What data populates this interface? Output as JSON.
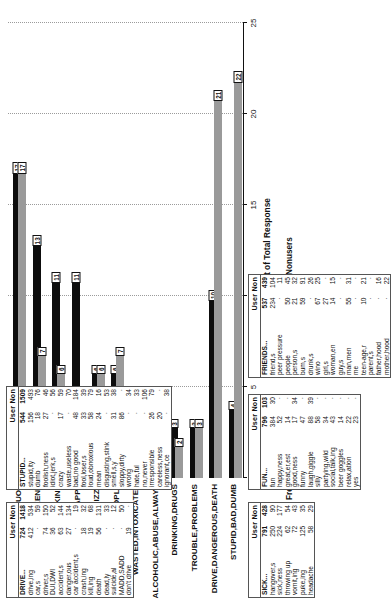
{
  "chart_data": {
    "type": "bar",
    "orientation": "horizontal",
    "xlabel": "Percent of Total Response",
    "ylabel": "",
    "xlim": [
      0,
      25
    ],
    "xticks": [
      0,
      5,
      10,
      15,
      20,
      25
    ],
    "grid": true,
    "legend_position": "bottom",
    "categories": [
      "ALCOHOL,BEER,LIQUOR",
      "PARTY,BAR,WEEKEND",
      "SICK,HANGOVER,PUKING",
      "FUN,LAUGH,HAPPY",
      "PASS OUT,FALL,DIZZY",
      "FRIENDS,BUMS,PEOPLE",
      "WASTED,INTOXICATED",
      "ALCOHOLIC,ABUSE,ALWAYS",
      "DRINKING,DRUGS",
      "TROUBLE,PROBLEMS",
      "DRIVE,DANGEROUS,DEATH",
      "STUPID,BAD,DUMB"
    ],
    "series": [
      {
        "name": "Frequent Users",
        "color": "#0d0d0d",
        "values": [
          17,
          13,
          11,
          11,
          6,
          6,
          4,
          3,
          3,
          3,
          10,
          4
        ]
      },
      {
        "name": "Nonusers",
        "color": "#9a9a9a",
        "values": [
          17,
          7,
          6,
          4,
          6,
          7,
          3,
          2,
          2,
          3,
          21,
          22
        ]
      }
    ]
  },
  "tables": [
    {
      "id": "drive-table",
      "header": "User Non",
      "col_user": "User",
      "col_non": "Non",
      "rows": [
        {
          "label": "DRIVE...",
          "user": "724",
          "non": "1418"
        },
        {
          "label": "drive,ing",
          "user": "412",
          "non": "534"
        },
        {
          "label": "car,s",
          "user": "·",
          "non": "59"
        },
        {
          "label": "driver,s",
          "user": "74",
          "non": "150"
        },
        {
          "label": "DUI,DWI",
          "user": "36",
          "non": "52"
        },
        {
          "label": "accident,s",
          "user": "63",
          "non": "144"
        },
        {
          "label": "danger,ous",
          "user": "27",
          "non": "134"
        },
        {
          "label": "car accident,s",
          "user": "·",
          "non": "19"
        },
        {
          "label": "crash,ing",
          "user": "18",
          "non": "32"
        },
        {
          "label": "kill,ing",
          "user": "19",
          "non": "68"
        },
        {
          "label": "death",
          "user": "56",
          "non": "131"
        },
        {
          "label": "dead,ly",
          "user": "·",
          "non": "33"
        },
        {
          "label": "suicide,al",
          "user": "·",
          "non": "12"
        },
        {
          "label": "MADD,SADD",
          "user": "·",
          "non": "50"
        },
        {
          "label": "don't drive",
          "user": "19",
          "non": "·"
        }
      ]
    },
    {
      "id": "stupid-table",
      "header": "User Non",
      "col_user": "User",
      "col_non": "Non",
      "rows": [
        {
          "label": "STUPID...",
          "user": "544",
          "non": "1509"
        },
        {
          "label": "stupid,ity",
          "user": "156",
          "non": "493"
        },
        {
          "label": "dumb",
          "user": "18",
          "non": "76"
        },
        {
          "label": "foolish,ness",
          "user": "27",
          "non": "46"
        },
        {
          "label": "idiot,jerk,s",
          "user": "·",
          "non": "56"
        },
        {
          "label": "crazy",
          "user": "17",
          "non": "59"
        },
        {
          "label": "waste,useless",
          "user": "·",
          "non": "70"
        },
        {
          "label": "bad,no good",
          "user": "48",
          "non": "184"
        },
        {
          "label": "fool,loser,s",
          "user": "33",
          "non": "39"
        },
        {
          "label": "loud,obnoxious",
          "user": "58",
          "non": "79"
        },
        {
          "label": "mean",
          "user": "24",
          "non": "16"
        },
        {
          "label": "disgusting,stink",
          "user": "·",
          "non": "53"
        },
        {
          "label": "smell,s,y",
          "user": "31",
          "non": "38"
        },
        {
          "label": "sloppy,dirty",
          "user": "86",
          "non": "·"
        },
        {
          "label": "wrong",
          "user": "·",
          "non": "34"
        },
        {
          "label": "hate,ful",
          "user": "·",
          "non": "33"
        },
        {
          "label": "no,never",
          "user": "·",
          "non": "106"
        },
        {
          "label": "irresponsible",
          "user": "26",
          "non": "79"
        },
        {
          "label": "careless,ness",
          "user": "20",
          "non": "·"
        },
        {
          "label": "ignorant,ce",
          "user": "·",
          "non": "38"
        }
      ]
    },
    {
      "id": "sick-table",
      "header": "User Non",
      "col_user": "User",
      "col_non": "Non",
      "rows": [
        {
          "label": "SICK...",
          "user": "791",
          "non": "428"
        },
        {
          "label": "hangover,s",
          "user": "250",
          "non": "90"
        },
        {
          "label": "sick,ness",
          "user": "224",
          "non": "177"
        },
        {
          "label": "throwing up",
          "user": "62",
          "non": "54"
        },
        {
          "label": "vomit,ing",
          "user": "72",
          "non": "43"
        },
        {
          "label": "puke,ing",
          "user": "125",
          "non": "35"
        },
        {
          "label": "headache",
          "user": "58",
          "non": "29"
        }
      ]
    },
    {
      "id": "fun-table",
      "header": "User Non",
      "col_user": "User",
      "col_non": "Non",
      "rows": [
        {
          "label": "FUN...",
          "user": "796",
          "non": "103"
        },
        {
          "label": "fun",
          "user": "384",
          "non": "30"
        },
        {
          "label": "happy,ness",
          "user": "52",
          "non": "·"
        },
        {
          "label": "great,er,est",
          "user": "14",
          "non": "·"
        },
        {
          "label": "good,ness",
          "user": "17",
          "non": "34"
        },
        {
          "label": "funny",
          "user": "47",
          "non": "·"
        },
        {
          "label": "laugh,giggle",
          "user": "88",
          "non": "39"
        },
        {
          "label": "silly",
          "user": "58",
          "non": "·"
        },
        {
          "label": "partying,wild",
          "user": "34",
          "non": "·"
        },
        {
          "label": "social,talk,ing",
          "user": "43",
          "non": "·"
        },
        {
          "label": "beer goggles",
          "user": "14",
          "non": "·"
        },
        {
          "label": "relax,ation",
          "user": "22",
          "non": "·"
        },
        {
          "label": "yes",
          "user": "23",
          "non": "·"
        }
      ]
    },
    {
      "id": "friends-table",
      "header": "User Non",
      "col_user": "User",
      "col_non": "Non",
      "rows": [
        {
          "label": "FRIENDS...",
          "user": "537",
          "non": "439"
        },
        {
          "label": "friend,s",
          "user": "234",
          "non": "104"
        },
        {
          "label": "peer pressure",
          "user": "·",
          "non": "11"
        },
        {
          "label": "people",
          "user": "50",
          "non": "45"
        },
        {
          "label": "person,s",
          "user": "21",
          "non": "32"
        },
        {
          "label": "bum,s",
          "user": "59",
          "non": "91"
        },
        {
          "label": "drunk,s",
          "user": "·",
          "non": "26"
        },
        {
          "label": "wino",
          "user": "67",
          "non": "25"
        },
        {
          "label": "girl,s",
          "user": "27",
          "non": "·"
        },
        {
          "label": "woman,en",
          "user": "14",
          "non": "15"
        },
        {
          "label": "guy,s",
          "user": "·",
          "non": "·"
        },
        {
          "label": "man,men",
          "user": "55",
          "non": "31"
        },
        {
          "label": "me",
          "user": "·",
          "non": "·"
        },
        {
          "label": "teen-age,r",
          "user": "10",
          "non": "21"
        },
        {
          "label": "parent,s",
          "user": "·",
          "non": "·"
        },
        {
          "label": "father,hood",
          "user": "·",
          "non": "16"
        },
        {
          "label": "mother,hood",
          "user": "·",
          "non": "22"
        }
      ]
    }
  ]
}
